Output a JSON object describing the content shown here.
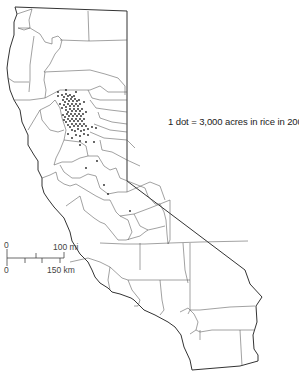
{
  "map": {
    "title": "California rice acreage dot map",
    "region": "California",
    "legend": {
      "label": "1 dot = 3,000 acres in rice in 2007"
    },
    "scale_bar": {
      "top_zero": "0",
      "top_end": "100 mi",
      "bottom_zero": "0",
      "bottom_end": "150 km"
    },
    "colors": {
      "background": "#ffffff",
      "boundary": "#333333",
      "dot": "#222222"
    }
  }
}
